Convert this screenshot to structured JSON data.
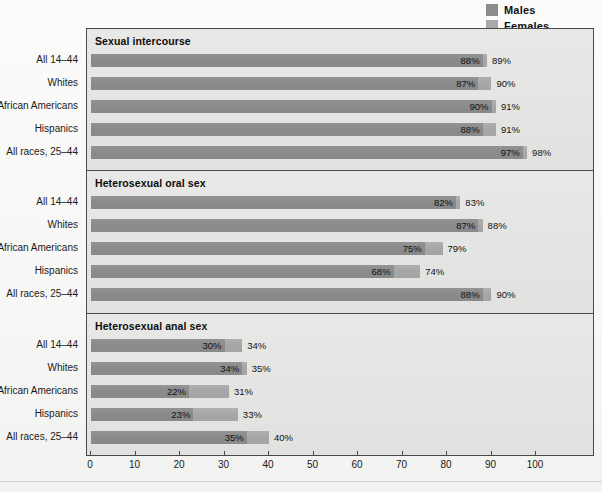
{
  "legend": {
    "items": [
      {
        "label": "Males",
        "color": "#8c8c8c"
      },
      {
        "label": "Females",
        "color": "#a9a9a9"
      }
    ]
  },
  "axis": {
    "ticks": [
      "0",
      "10",
      "20",
      "30",
      "40",
      "50",
      "60",
      "70",
      "80",
      "90",
      "100"
    ],
    "min": 0,
    "max": 100
  },
  "categories": [
    "All 14–44",
    "Whites",
    "African Americans",
    "Hispanics",
    "All races, 25–44"
  ],
  "panels": [
    {
      "title": "Sexual intercourse",
      "rows": [
        {
          "category": "All 14–44",
          "male": 88,
          "female": 89,
          "male_label": "88%",
          "female_label": "89%"
        },
        {
          "category": "Whites",
          "male": 87,
          "female": 90,
          "male_label": "87%",
          "female_label": "90%"
        },
        {
          "category": "African Americans",
          "male": 90,
          "female": 91,
          "male_label": "90%",
          "female_label": "91%"
        },
        {
          "category": "Hispanics",
          "male": 88,
          "female": 91,
          "male_label": "88%",
          "female_label": "91%"
        },
        {
          "category": "All races, 25–44",
          "male": 97,
          "female": 98,
          "male_label": "97%",
          "female_label": "98%"
        }
      ]
    },
    {
      "title": "Heterosexual oral sex",
      "rows": [
        {
          "category": "All 14–44",
          "male": 82,
          "female": 83,
          "male_label": "82%",
          "female_label": "83%"
        },
        {
          "category": "Whites",
          "male": 87,
          "female": 88,
          "male_label": "87%",
          "female_label": "88%"
        },
        {
          "category": "African Americans",
          "male": 75,
          "female": 79,
          "male_label": "75%",
          "female_label": "79%"
        },
        {
          "category": "Hispanics",
          "male": 68,
          "female": 74,
          "male_label": "68%",
          "female_label": "74%"
        },
        {
          "category": "All races, 25–44",
          "male": 88,
          "female": 90,
          "male_label": "88%",
          "female_label": "90%"
        }
      ]
    },
    {
      "title": "Heterosexual anal sex",
      "rows": [
        {
          "category": "All 14–44",
          "male": 30,
          "female": 34,
          "male_label": "30%",
          "female_label": "34%"
        },
        {
          "category": "Whites",
          "male": 34,
          "female": 35,
          "male_label": "34%",
          "female_label": "35%"
        },
        {
          "category": "African Americans",
          "male": 22,
          "female": 31,
          "male_label": "22%",
          "female_label": "31%"
        },
        {
          "category": "Hispanics",
          "male": 23,
          "female": 33,
          "male_label": "23%",
          "female_label": "33%"
        },
        {
          "category": "All races, 25–44",
          "male": 35,
          "female": 40,
          "male_label": "35%",
          "female_label": "40%"
        }
      ]
    }
  ],
  "chart_data": {
    "type": "bar",
    "orientation": "horizontal",
    "title": "",
    "xlabel": "",
    "ylabel": "",
    "xlim": [
      0,
      100
    ],
    "xticks": [
      0,
      10,
      20,
      30,
      40,
      50,
      60,
      70,
      80,
      90,
      100
    ],
    "grid": false,
    "legend_position": "top-right",
    "legend": [
      "Males",
      "Females"
    ],
    "categories": [
      "All 14–44",
      "Whites",
      "African Americans",
      "Hispanics",
      "All races, 25–44"
    ],
    "panels": [
      {
        "title": "Sexual intercourse",
        "series": [
          {
            "name": "Males",
            "values": [
              88,
              87,
              90,
              88,
              97
            ]
          },
          {
            "name": "Females",
            "values": [
              89,
              90,
              91,
              91,
              98
            ]
          }
        ]
      },
      {
        "title": "Heterosexual oral sex",
        "series": [
          {
            "name": "Males",
            "values": [
              82,
              87,
              75,
              68,
              88
            ]
          },
          {
            "name": "Females",
            "values": [
              83,
              88,
              79,
              74,
              90
            ]
          }
        ]
      },
      {
        "title": "Heterosexual anal sex",
        "series": [
          {
            "name": "Males",
            "values": [
              30,
              34,
              22,
              23,
              35
            ]
          },
          {
            "name": "Females",
            "values": [
              34,
              35,
              31,
              33,
              40
            ]
          }
        ]
      }
    ],
    "units": "percent",
    "value_labels_shown": true
  },
  "colors": {
    "male_bar": "#8c8c8c",
    "female_bar": "#a9a9a9",
    "panel_background": "#e4e4e2",
    "frame": "#4a4a4a"
  }
}
